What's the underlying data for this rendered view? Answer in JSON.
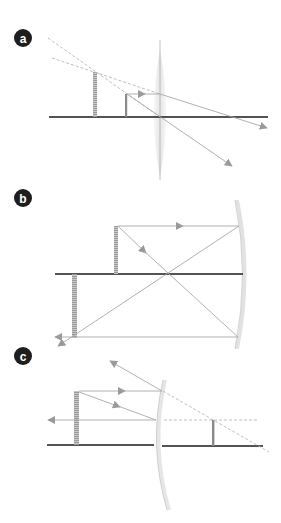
{
  "colors": {
    "axis": "#1a1a1a",
    "ray": "#a8a8a8",
    "arrowhead": "#9a9a9a",
    "dashed": "#b8b8b8",
    "object": "#8a8a8a",
    "lens_fill": "#ececec",
    "mirror_fill": "#e2e2e2",
    "label_bg": "#1e1e1e",
    "label_fg": "#ffffff"
  },
  "panels": [
    {
      "id": "a",
      "label": "a",
      "description": "Converging lens with object inside focal length forming virtual enlarged image"
    },
    {
      "id": "b",
      "label": "b",
      "description": "Concave mirror forming real inverted enlarged image"
    },
    {
      "id": "c",
      "label": "c",
      "description": "Convex mirror forming virtual reduced upright image"
    }
  ]
}
